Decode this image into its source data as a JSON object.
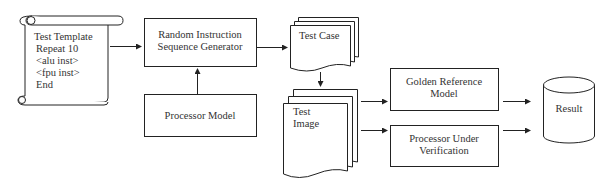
{
  "diagram": {
    "test_template": {
      "lines": [
        "Test Template",
        "Repeat 10",
        "<alu inst>",
        "<fpu inst>",
        "End"
      ]
    },
    "generator": {
      "line1": "Random Instruction",
      "line2": "Sequence Generator"
    },
    "processor_model": {
      "label": "Processor Model"
    },
    "test_case": {
      "label": "Test Case"
    },
    "test_image": {
      "line1": "Test",
      "line2": "Image"
    },
    "golden_reference": {
      "line1": "Golden Reference",
      "line2": "Model"
    },
    "processor_under_verification": {
      "line1": "Processor Under",
      "line2": "Verification"
    },
    "result": {
      "label": "Result"
    },
    "edges": [
      {
        "from": "test_template",
        "to": "generator"
      },
      {
        "from": "processor_model",
        "to": "generator"
      },
      {
        "from": "generator",
        "to": "test_case"
      },
      {
        "from": "test_case",
        "to": "test_image"
      },
      {
        "from": "test_image",
        "to": "golden_reference"
      },
      {
        "from": "test_image",
        "to": "processor_under_verification"
      },
      {
        "from": "golden_reference",
        "to": "result"
      },
      {
        "from": "processor_under_verification",
        "to": "result"
      }
    ]
  }
}
